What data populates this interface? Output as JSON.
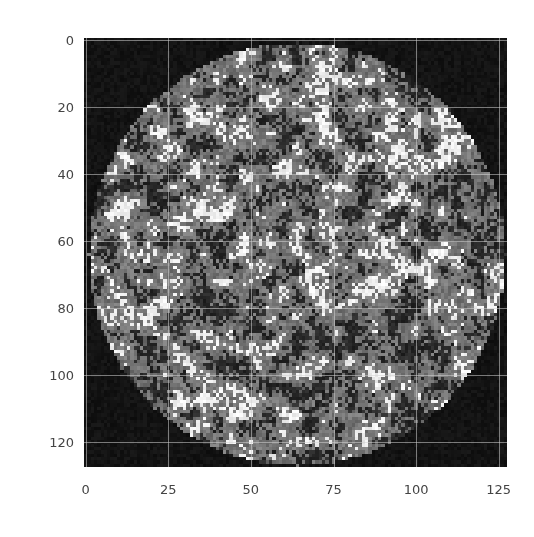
{
  "chart_data": {
    "type": "heatmap",
    "title": "",
    "xlabel": "",
    "ylabel": "",
    "image_size": [
      128,
      128
    ],
    "xlim": [
      0,
      127
    ],
    "ylim": [
      127,
      0
    ],
    "x_ticks": [
      0,
      25,
      50,
      75,
      100,
      125
    ],
    "y_ticks": [
      0,
      20,
      40,
      60,
      80,
      100,
      120
    ],
    "x_tick_labels": [
      "0",
      "25",
      "50",
      "75",
      "100",
      "125"
    ],
    "y_tick_labels": [
      "0",
      "20",
      "40",
      "60",
      "80",
      "100",
      "120"
    ],
    "grid": true,
    "colormap": "gray",
    "disk": {
      "center": [
        64,
        64
      ],
      "radius": 63
    }
  },
  "colors": {
    "background": "#111111",
    "grid": "#d2d2d2",
    "tick_label": "#444444"
  }
}
